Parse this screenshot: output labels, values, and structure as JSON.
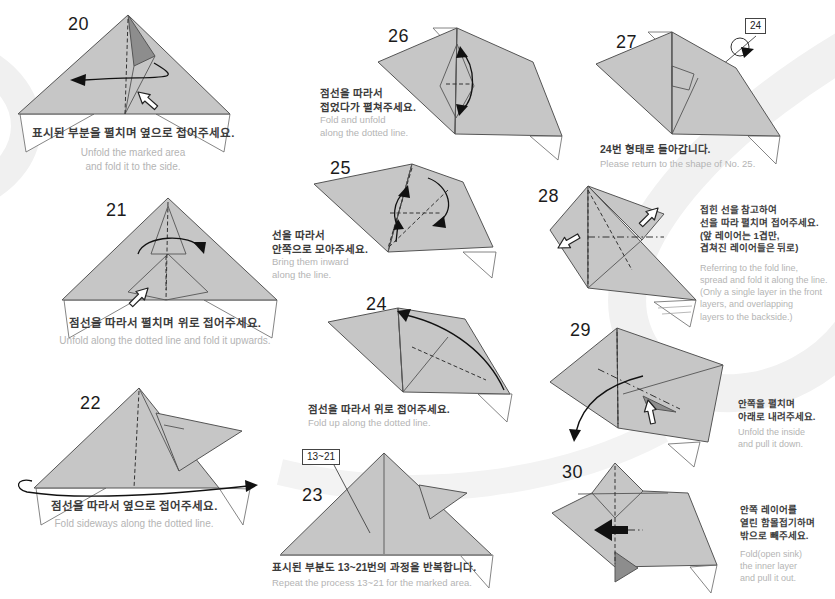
{
  "palette": {
    "paper": "#c6c6c6",
    "paper_dark": "#8d8d8d",
    "line": "#555555",
    "korean_text": "#3c3c3c",
    "english_text": "#b4b4b4"
  },
  "steps": [
    {
      "number": "20",
      "caption_ko": "표시된 부분을 펼치며 옆으로 접어주세요.",
      "caption_en": "Unfold the marked area\nand fold it to the side."
    },
    {
      "number": "21",
      "caption_ko": "점선을 따라서 펼치며 위로 접어주세요.",
      "caption_en": "Unfold along the dotted line and fold it upwards."
    },
    {
      "number": "22",
      "caption_ko": "점선을 따라서 옆으로 접어주세요.",
      "caption_en": "Fold sideways along the dotted line."
    },
    {
      "number": "23",
      "label": "13~21",
      "caption_ko": "표시된 부분도 13~21번의 과정을 반복합니다.",
      "caption_en": "Repeat the process 13~21 for the marked area."
    },
    {
      "number": "24",
      "caption_ko": "점선을 따라서 위로 접어주세요.",
      "caption_en": "Fold up along the dotted line."
    },
    {
      "number": "25",
      "caption_ko": "선을 따라서\n안쪽으로 모아주세요.",
      "caption_en": "Bring them inward\nalong the line."
    },
    {
      "number": "26",
      "caption_ko": "점선을 따라서\n접었다가 펼쳐주세요.",
      "caption_en": "Fold and unfold\nalong the dotted line."
    },
    {
      "number": "27",
      "label": "24",
      "caption_ko": "24번 형태로 돌아갑니다.",
      "caption_en": "Please return to the shape of No. 25."
    },
    {
      "number": "28",
      "caption_ko": "접힌 선을 참고하여\n선을 따라 펼치며 접어주세요.\n(앞 레이어는 1겹만,\n겹쳐진 레이어들은 뒤로)",
      "caption_en": "Referring to the fold line,\nspread and fold it along the line.\n(Only a single layer in the front\nlayers, and overlapping\nlayers to the backside.)"
    },
    {
      "number": "29",
      "caption_ko": "안쪽을 펼치며\n아래로 내려주세요.",
      "caption_en": "Unfold the inside\nand pull it down."
    },
    {
      "number": "30",
      "caption_ko": "안쪽 레이어를\n열린 함몰접기하며\n밖으로 빼주세요.",
      "caption_en": "Fold(open sink)\nthe inner layer\nand pull it out."
    }
  ]
}
